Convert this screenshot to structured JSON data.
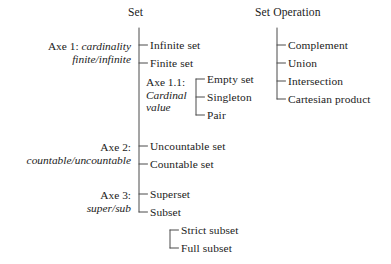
{
  "diagram": {
    "title_left": "Set",
    "title_right": "Set Operation",
    "axes": {
      "axe1_name": "Axe 1:",
      "axe1_value": "cardinality",
      "axe1_value2": "finite/infinite",
      "axe11_name": "Axe 1.1:",
      "axe11_value": "Cardinal",
      "axe11_value2": "value",
      "axe2_name": "Axe 2:",
      "axe2_value": "countable/uncountable",
      "axe3_name": "Axe 3:",
      "axe3_value": "super/sub"
    },
    "nodes": {
      "infinite_set": "Infinite set",
      "finite_set": "Finite set",
      "empty_set": "Empty set",
      "singleton": "Singleton",
      "pair": "Pair",
      "uncountable_set": "Uncountable set",
      "countable_set": "Countable set",
      "superset": "Superset",
      "subset": "Subset",
      "strict_subset": "Strict subset",
      "full_subset": "Full subset",
      "complement": "Complement",
      "union": "Union",
      "intersection": "Intersection",
      "cartesian_product": "Cartesian product"
    },
    "colors": {
      "ink": "#1b1b1b",
      "line": "#4a4a4a",
      "background": "#ffffff"
    }
  }
}
